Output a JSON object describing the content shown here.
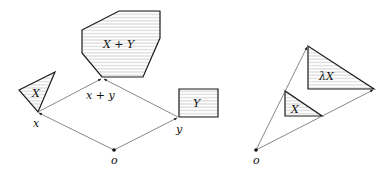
{
  "left_diagram": {
    "title": "Minkowski sum",
    "points": {
      "o": {
        "label": "o",
        "x": 114,
        "y": 150
      },
      "x": {
        "label": "x",
        "x": 38,
        "y": 112
      },
      "y": {
        "label": "y",
        "x": 178,
        "y": 117
      },
      "xy": {
        "label": "x + y",
        "x": 102,
        "y": 78
      }
    },
    "shapes": {
      "X": {
        "label": "X",
        "points": "19,90 55,72 38,112"
      },
      "XY": {
        "label": "X + Y",
        "points": "82,30 119,11 160,11 160,38 143,77 102,77 82,53"
      },
      "Y": {
        "label": "Y",
        "points": "179,89 218,89 218,117 179,117"
      }
    }
  },
  "right_diagram": {
    "title": "Scalar multiple",
    "points": {
      "o": {
        "label": "o",
        "x": 256,
        "y": 150
      }
    },
    "shapes": {
      "X": {
        "label": "X",
        "points": "285,91 285,116 322,116"
      },
      "lambdaX": {
        "label": "λX",
        "points": "308,46 308,89 374,89"
      }
    }
  },
  "colors": {
    "stroke": "#1a1a1a",
    "arrow": "#555555",
    "hatch": "#9a9a9a",
    "background": "#ffffff"
  }
}
